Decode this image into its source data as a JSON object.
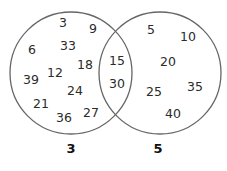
{
  "diagram": {
    "type": "venn",
    "title_visible": false,
    "sets": [
      {
        "id": "A",
        "label": "3",
        "description": "multiples of 3",
        "circle": {
          "cx": 71,
          "cy": 73,
          "r": 61
        },
        "only_elements": [
          {
            "value": "3",
            "x": 63,
            "y": 27
          },
          {
            "value": "9",
            "x": 93,
            "y": 33
          },
          {
            "value": "33",
            "x": 68,
            "y": 50
          },
          {
            "value": "6",
            "x": 32,
            "y": 54
          },
          {
            "value": "18",
            "x": 85,
            "y": 69
          },
          {
            "value": "12",
            "x": 55,
            "y": 77
          },
          {
            "value": "39",
            "x": 31,
            "y": 84
          },
          {
            "value": "24",
            "x": 75,
            "y": 95
          },
          {
            "value": "21",
            "x": 41,
            "y": 108
          },
          {
            "value": "27",
            "x": 91,
            "y": 117
          },
          {
            "value": "36",
            "x": 64,
            "y": 122
          }
        ],
        "label_pos": {
          "x": 71,
          "y": 153
        }
      },
      {
        "id": "B",
        "label": "5",
        "description": "multiples of 5",
        "circle": {
          "cx": 160,
          "cy": 73,
          "r": 61
        },
        "only_elements": [
          {
            "value": "5",
            "x": 151,
            "y": 34
          },
          {
            "value": "10",
            "x": 188,
            "y": 41
          },
          {
            "value": "20",
            "x": 168,
            "y": 66
          },
          {
            "value": "35",
            "x": 195,
            "y": 91
          },
          {
            "value": "25",
            "x": 154,
            "y": 96
          },
          {
            "value": "40",
            "x": 173,
            "y": 118
          }
        ],
        "label_pos": {
          "x": 158,
          "y": 153
        }
      }
    ],
    "intersection": [
      {
        "value": "15",
        "x": 117,
        "y": 65
      },
      {
        "value": "30",
        "x": 117,
        "y": 88
      }
    ],
    "colors": {
      "stroke": "#666666",
      "text": "#2b2b2b",
      "label": "#111111",
      "background": "#ffffff"
    }
  }
}
